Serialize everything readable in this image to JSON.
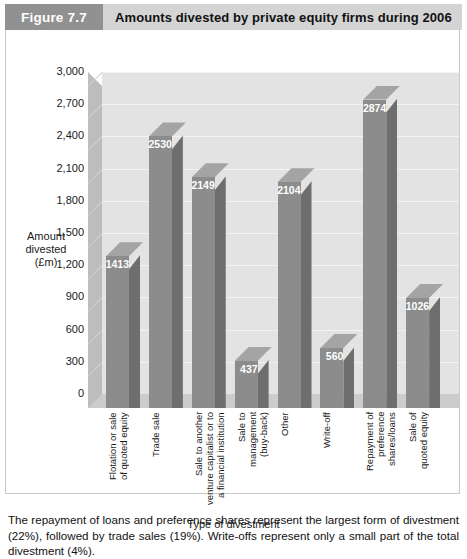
{
  "header": {
    "badge": "Figure 7.7",
    "title": "Amounts divested by private equity firms during 2006"
  },
  "chart_data": {
    "type": "bar",
    "title": "Amounts divested by private equity firms during 2006",
    "xlabel": "Type of divestment",
    "ylabel": "Amount divested (£m)",
    "ylabel_lines": [
      "Amount",
      "divested",
      "(£m)"
    ],
    "ylim": [
      0,
      3000
    ],
    "yticks": [
      0,
      300,
      600,
      900,
      1200,
      1500,
      1800,
      2100,
      2400,
      2700,
      3000
    ],
    "ytick_labels": [
      "0",
      "300",
      "600",
      "900",
      "1,200",
      "1,500",
      "1,800",
      "2,100",
      "2,400",
      "2,700",
      "3,000"
    ],
    "grid": true,
    "legend": "none",
    "style": "3d-column",
    "categories": [
      "Flotation or sale\nof quoted equity",
      "Trade sale",
      "Sale to another\nventure capitalist or to\na financial institution",
      "Sale to\nmanagement\n(buy-back)",
      "Other",
      "Write-off",
      "Repayment of\npreference\nshares/loans",
      "Sale of\nquoted equity"
    ],
    "values": [
      1413,
      2530,
      2149,
      437,
      2104,
      560,
      2874,
      1026
    ],
    "data_labels": [
      "1413",
      "2530",
      "2149",
      "437",
      "2104",
      "560",
      "2874",
      "1026"
    ],
    "colors": {
      "bar_front": "#8c8c8c",
      "bar_side": "#6e6e6e",
      "bar_top": "#a4a4a4",
      "back_wall": "#e3e3e3",
      "side_wall": "#bdbdbd",
      "floor": "#cccccc",
      "header_band": "#d4d4d4",
      "header_badge": "#919191"
    }
  },
  "caption": "The repayment of loans and preference shares represent the largest form of divestment (22%), followed by trade sales (19%). Write-offs represent only a small part of the total divestment (4%)."
}
